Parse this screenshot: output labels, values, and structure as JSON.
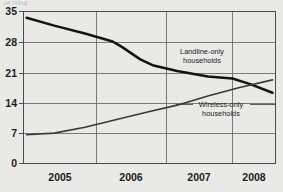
{
  "figure": {
    "background_color": "#e9e9e6",
    "cropped_header_text": "of 2004",
    "line_color_landline": "#141414",
    "line_color_wireless": "#3a3a38",
    "grid_color": "#6f6f6d"
  },
  "chart_data": {
    "type": "line",
    "title": "",
    "subtitle": "",
    "xlabel": "",
    "ylabel": "",
    "xlim": [
      2004.5,
      2008.6
    ],
    "ylim": [
      0,
      36.5
    ],
    "yticks": [
      0,
      7,
      14,
      21,
      28,
      35
    ],
    "ytick_labels": [
      "0",
      "7",
      "14",
      "21",
      "28",
      "35"
    ],
    "xticks": [
      2005,
      2006,
      2007,
      2008
    ],
    "xtick_labels": [
      "2005",
      "2006",
      "2007",
      "2008"
    ],
    "grid": true,
    "grid_axis": "both",
    "legend": "annotations",
    "series": [
      {
        "name": "Landline-only households",
        "label_position": "inside-upper-right",
        "x": [
          2004.55,
          2005.0,
          2005.5,
          2005.95,
          2006.1,
          2006.4,
          2006.6,
          2007.0,
          2007.5,
          2007.9,
          2008.2,
          2008.55
        ],
        "values": [
          35.0,
          33.1,
          31.2,
          29.3,
          28.0,
          25.0,
          23.6,
          22.2,
          20.9,
          20.4,
          19.0,
          17.0
        ]
      },
      {
        "name": "Wireless-only households",
        "label_position": "inside-lower-right",
        "x": [
          2004.55,
          2005.0,
          2005.5,
          2006.0,
          2006.5,
          2007.0,
          2007.5,
          2008.0,
          2008.55
        ],
        "values": [
          6.9,
          7.3,
          8.7,
          10.5,
          12.3,
          14.0,
          16.2,
          18.2,
          20.1
        ]
      }
    ],
    "annotations": [
      {
        "id": "landline-annotation",
        "lines": [
          "Landline-only",
          "households"
        ],
        "x": 2007.0,
        "y": 25.0
      },
      {
        "id": "wireless-annotation",
        "lines": [
          "Wireless-only",
          "households"
        ],
        "x": 2007.55,
        "y": 13.2,
        "leader": true
      }
    ]
  }
}
